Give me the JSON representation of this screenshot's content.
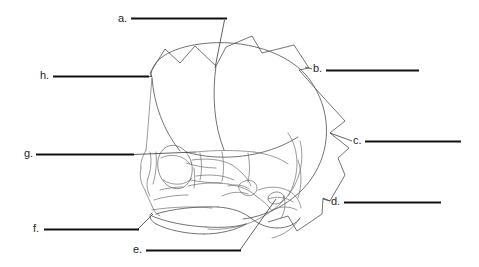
{
  "figure": {
    "background_color": "#ffffff",
    "line_color": "#5a5a5a",
    "rule_color": "#111111",
    "text_color": "#262626",
    "width": 479,
    "height": 267
  },
  "labels": [
    {
      "key": "a",
      "text": "a.",
      "text_x": 118,
      "text_y": 22,
      "rule": {
        "x1": 131,
        "y1": 18.5,
        "x2": 227,
        "y2": 18.5
      },
      "leader": {
        "x1": 224.5,
        "y1": 20,
        "x2": 215,
        "y2": 68
      },
      "answer": ""
    },
    {
      "key": "b",
      "text": "b.",
      "text_x": 313,
      "text_y": 72,
      "rule": {
        "x1": 326,
        "y1": 70.5,
        "x2": 419,
        "y2": 70.5
      },
      "leader": {
        "x1": 312,
        "y1": 69,
        "x2": 305,
        "y2": 67
      },
      "answer": ""
    },
    {
      "key": "c",
      "text": "c.",
      "text_x": 353,
      "text_y": 144,
      "rule": {
        "x1": 365,
        "y1": 141.5,
        "x2": 461,
        "y2": 141.5
      },
      "leader": {
        "x1": 352,
        "y1": 141,
        "x2": 330,
        "y2": 133
      },
      "answer": ""
    },
    {
      "key": "d",
      "text": "d.",
      "text_x": 331,
      "text_y": 205,
      "rule": {
        "x1": 344,
        "y1": 202.5,
        "x2": 441,
        "y2": 202.5
      },
      "leader": {
        "x1": 330,
        "y1": 201,
        "x2": 323,
        "y2": 199
      },
      "answer": ""
    },
    {
      "key": "e",
      "text": "e.",
      "text_x": 133,
      "text_y": 253,
      "rule": {
        "x1": 146,
        "y1": 250.5,
        "x2": 241,
        "y2": 250.5
      },
      "leader": {
        "x1": 240,
        "y1": 250,
        "x2": 276,
        "y2": 199
      },
      "answer": ""
    },
    {
      "key": "f",
      "text": "f.",
      "text_x": 33,
      "text_y": 232,
      "rule": {
        "x1": 44,
        "y1": 229.5,
        "x2": 139,
        "y2": 229.5
      },
      "leader": {
        "x1": 138,
        "y1": 229,
        "x2": 153,
        "y2": 214
      },
      "answer": ""
    },
    {
      "key": "g",
      "text": "g.",
      "text_x": 24,
      "text_y": 157,
      "rule": {
        "x1": 36,
        "y1": 154.5,
        "x2": 134,
        "y2": 154.5
      },
      "leader": {
        "x1": 133,
        "y1": 154.5,
        "x2": 196,
        "y2": 152
      },
      "answer": ""
    },
    {
      "key": "h",
      "text": "h.",
      "text_x": 40,
      "text_y": 79,
      "rule": {
        "x1": 53,
        "y1": 76.5,
        "x2": 149,
        "y2": 76.5
      },
      "leader": {
        "x1": 148,
        "y1": 76.5,
        "x2": 152,
        "y2": 76.5
      },
      "answer": ""
    }
  ],
  "drawing": {
    "overlay_polygon": "M152 77 L150 73 L165 49 L180 63 L195 46 L216 66 L226 47 L252 36 L262 53 L294 45 L309 68 L299 70 L323 97 L345 121 L330 133 L349 148 L338 158 L345 175 L330 201 L323 198 L322 214 L297 231 L288 216 L268 222",
    "cranium_outline": "M151 76 C151 60 170 48 200 44 C243 38 290 52 310 80 C330 108 332 144 315 173 C300 199 270 216 243 219",
    "parietal_curve": "M152 78 C154 104 163 130 180 151",
    "coronal_suture": "M216 66 C212 95 214 125 224 150",
    "squamous_suture": "M186 152 C220 162 265 158 298 137",
    "occipital_line": "M300 141 C305 160 300 183 285 199",
    "lambdoid": "M288 133 C300 150 300 176 288 196",
    "face_lines": [
      "M152 78 C150 100 148 130 146 150",
      "M146 150 C143 156 140 162 141 168",
      "M141 168 C139 176 141 184 145 190",
      "M145 190 C147 196 150 201 152 206",
      "M152 206 C154 211 156 214 160 216",
      "M150 152 C152 160 151 170 148 178",
      "M148 178 C146 184 147 190 150 196",
      "M156 152 C157 163 156 174 153 184",
      "M160 190 C168 188 176 187 183 187",
      "M154 200 C163 197 176 195 188 195",
      "M152 210 C170 207 192 206 212 208"
    ],
    "orbit_ellipse": {
      "cx": 175,
      "cy": 167,
      "rx": 17,
      "ry": 22,
      "rot": -14
    },
    "orbit_inner": "M161 158 C170 153 184 155 190 164",
    "orbit_lower": "M163 180 C172 186 186 186 192 178",
    "zygomatic": [
      "M192 160 C206 158 222 159 232 165",
      "M232 165 C241 171 248 178 251 186",
      "M196 176 C210 174 224 175 234 180",
      "M188 186 C200 183 215 182 228 184",
      "M228 184 C240 186 250 190 256 196"
    ],
    "nasal_maxilla": [
      "M186 163 C195 166 206 168 216 168",
      "M190 180 C200 182 212 183 222 183",
      "M194 168 C195 176 195 182 194 188"
    ],
    "mandible": [
      "M156 214 C172 209 196 206 218 207",
      "M218 207 C232 208 244 212 252 219",
      "M252 219 C260 225 268 228 277 228",
      "M277 228 C288 228 296 224 300 218",
      "M152 216 C166 222 186 226 206 227",
      "M206 227 C222 228 236 227 246 224",
      "M246 224 C236 230 220 234 204 234",
      "M204 234 C186 234 168 230 156 224",
      "M156 224 C150 220 148 216 152 213"
    ],
    "condyle_coronoid": [
      "M240 184 C244 180 250 179 254 182",
      "M254 182 C258 185 258 191 254 194",
      "M254 194 C250 197 244 196 241 192",
      "M241 192 C238 189 238 186 240 184",
      "M228 186 C236 184 244 185 249 189",
      "M222 196 C230 192 240 191 248 194",
      "M256 196 C262 200 268 205 272 211"
    ],
    "temporal_mastoid": [
      "M258 190 C268 186 280 186 289 191",
      "M289 191 C296 195 300 201 301 208",
      "M268 199 C276 196 286 197 293 202",
      "M272 210 C280 206 290 206 297 210",
      "M284 196 C286 204 285 212 281 218",
      "M298 160 C302 172 302 186 298 198"
    ],
    "ear_canal": {
      "cx": 276,
      "cy": 198,
      "rx": 8,
      "ry": 6,
      "rot": -10
    },
    "sphenoid_region": [
      "M196 152 C214 150 236 150 254 152",
      "M254 152 C268 154 280 158 288 164",
      "M200 153 C202 162 202 172 200 180",
      "M222 152 C224 162 224 172 222 181",
      "M248 153 C250 163 250 173 248 182"
    ],
    "occipital_tail": [
      "M285 199 C272 213 256 222 240 226",
      "M240 226 C228 229 216 230 208 229",
      "M300 218 C294 228 284 235 272 238"
    ]
  }
}
